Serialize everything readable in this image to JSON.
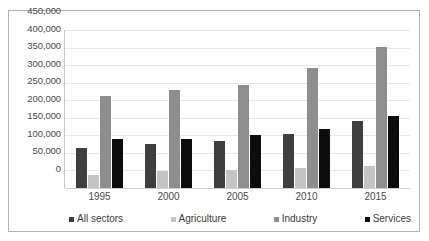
{
  "chart_data": {
    "type": "bar",
    "title": "",
    "xlabel": "",
    "ylabel": "",
    "categories": [
      "1995",
      "2000",
      "2005",
      "2010",
      "2015"
    ],
    "ylim": [
      0,
      450000
    ],
    "ytick_values": [
      0,
      50000,
      100000,
      150000,
      200000,
      250000,
      300000,
      350000,
      400000,
      450000
    ],
    "ytick_labels": [
      "0",
      "50,000",
      "100,000",
      "150,000",
      "200,000",
      "250,000",
      "300,000",
      "350,000",
      "400,000",
      "450,000"
    ],
    "grid": true,
    "legend_position": "bottom",
    "series": [
      {
        "name": "All sectors",
        "color": "#3f3f3f",
        "values": [
          115000,
          125000,
          133000,
          155000,
          190000
        ]
      },
      {
        "name": "Agriculture",
        "color": "#c4c4c4",
        "values": [
          38000,
          48000,
          50000,
          57000,
          62000
        ]
      },
      {
        "name": "Industry",
        "color": "#8e8e8e",
        "values": [
          262000,
          280000,
          292000,
          342000,
          402000
        ]
      },
      {
        "name": "Services",
        "color": "#0d0d0d",
        "values": [
          140000,
          140000,
          152000,
          167000,
          205000
        ]
      }
    ]
  }
}
